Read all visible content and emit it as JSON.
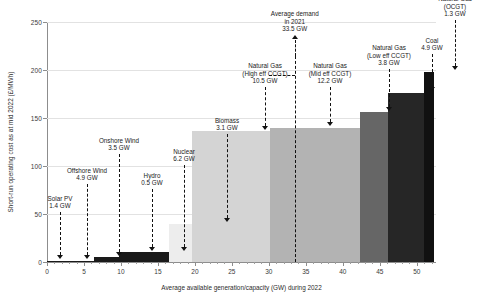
{
  "chart_data": {
    "type": "bar",
    "title": "",
    "subtitle": "",
    "xlabel": "Average available generation/capacity (GW) during 2022",
    "ylabel": "Short-run operating cost as at mid 2022 (£/MWh)",
    "xlim": [
      0,
      52.6
    ],
    "ylim": [
      0,
      250
    ],
    "xticks": [
      0,
      5,
      10,
      15,
      20,
      25,
      30,
      35,
      40,
      45,
      50
    ],
    "yticks": [
      0,
      50,
      100,
      150,
      200,
      250
    ],
    "grid": "horizontal",
    "legend": "none",
    "note": "Merit-order / supply-curve: segment widths are capacity (GW), heights are short-run operating cost (£/MWh), ordered cheapest to most expensive.",
    "categories": [
      "Solar PV",
      "Offshore Wind",
      "Onshore Wind",
      "Hydro",
      "Nuclear",
      "Biomass",
      "Natural Gas (High eff CCGT)",
      "Natural Gas (Mid eff CCGT)",
      "Natural Gas (Low eff CCGT)",
      "Coal",
      "Natural Gas (OCGT)"
    ],
    "widths_gw": [
      1.4,
      4.9,
      3.5,
      0.5,
      6.2,
      3.1,
      10.5,
      12.2,
      3.8,
      4.9,
      1.3
    ],
    "values": [
      1,
      1,
      5,
      10,
      10,
      40,
      136,
      140,
      156,
      176,
      198
    ],
    "segments": [
      {
        "name": "Solar PV",
        "capacity_gw": 1.4,
        "x_start": 0.0,
        "x_end": 1.4,
        "cost": 1,
        "color": "#1a1a1a",
        "label_line1": "Solar PV",
        "label_line2": "",
        "label_line3": "1.4 GW"
      },
      {
        "name": "Offshore Wind",
        "capacity_gw": 4.9,
        "x_start": 1.4,
        "x_end": 6.3,
        "cost": 1,
        "color": "#1a1a1a",
        "label_line1": "Offshore Wind",
        "label_line2": "",
        "label_line3": "4.9 GW"
      },
      {
        "name": "Onshore Wind",
        "capacity_gw": 3.5,
        "x_start": 6.3,
        "x_end": 9.8,
        "cost": 5,
        "color": "#1a1a1a",
        "label_line1": "Onshore Wind",
        "label_line2": "",
        "label_line3": "3.5 GW"
      },
      {
        "name": "Hydro",
        "capacity_gw": 0.5,
        "x_start": 9.8,
        "x_end": 10.3,
        "cost": 10,
        "color": "#1a1a1a",
        "label_line1": "Hydro",
        "label_line2": "",
        "label_line3": "0.5 GW"
      },
      {
        "name": "Nuclear",
        "capacity_gw": 6.2,
        "x_start": 10.3,
        "x_end": 16.5,
        "cost": 10,
        "color": "#1a1a1a",
        "label_line1": "Nuclear",
        "label_line2": "",
        "label_line3": "6.2 GW"
      },
      {
        "name": "Biomass",
        "capacity_gw": 3.1,
        "x_start": 16.5,
        "x_end": 19.6,
        "cost": 40,
        "color": "#ededed",
        "label_line1": "Biomass",
        "label_line2": "",
        "label_line3": "3.1 GW"
      },
      {
        "name": "Natural Gas (High eff CCGT)",
        "capacity_gw": 10.5,
        "x_start": 19.6,
        "x_end": 30.1,
        "cost": 136,
        "color": "#d4d4d4",
        "label_line1": "Natural Gas",
        "label_line2": "(High eff CCGT)",
        "label_line3": "10.5 GW"
      },
      {
        "name": "Natural Gas (Mid eff CCGT)",
        "capacity_gw": 12.2,
        "x_start": 30.1,
        "x_end": 42.3,
        "cost": 140,
        "color": "#b3b3b3",
        "label_line1": "Natural Gas",
        "label_line2": "(Mid eff CCGT)",
        "label_line3": "12.2 GW"
      },
      {
        "name": "Natural Gas (Low eff CCGT)",
        "capacity_gw": 3.8,
        "x_start": 42.3,
        "x_end": 46.1,
        "cost": 156,
        "color": "#666666",
        "label_line1": "Natural Gas",
        "label_line2": "(Low eff CCGT)",
        "label_line3": "3.8 GW"
      },
      {
        "name": "Coal",
        "capacity_gw": 4.9,
        "x_start": 46.1,
        "x_end": 51.0,
        "cost": 176,
        "color": "#262626",
        "label_line1": "Coal",
        "label_line2": "",
        "label_line3": "4.9 GW"
      },
      {
        "name": "Natural Gas (OCGT)",
        "capacity_gw": 1.3,
        "x_start": 51.0,
        "x_end": 52.3,
        "cost": 198,
        "color": "#111111",
        "label_line1": "Natural Gas",
        "label_line2": "(OCGT)",
        "label_line3": "1.3 GW"
      }
    ],
    "annotations": [
      {
        "id": "demand-line",
        "label_line1": "Average demand",
        "label_line2": "in 2021",
        "label_line3": "33.5 GW",
        "x_value": 33.5,
        "style": "dashed-vertical-with-up-arrow"
      }
    ]
  },
  "axis": {
    "y_tick_labels": [
      "0",
      "50",
      "100",
      "150",
      "200",
      "250"
    ],
    "x_tick_labels": [
      "0",
      "5",
      "10",
      "15",
      "20",
      "25",
      "30",
      "35",
      "40",
      "45",
      "50"
    ]
  }
}
